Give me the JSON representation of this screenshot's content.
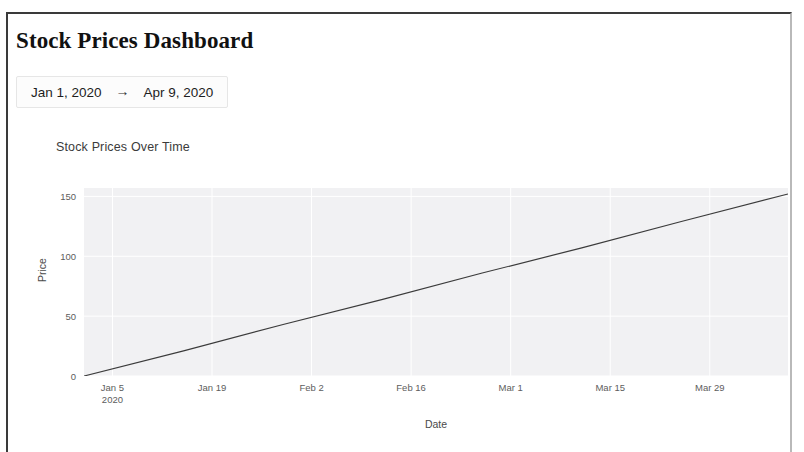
{
  "header": {
    "title": "Stock Prices Dashboard"
  },
  "date_range": {
    "start": "Jan 1, 2020",
    "arrow": "→",
    "end": "Apr 9, 2020"
  },
  "chart_data": {
    "type": "line",
    "title": "Stock Prices Over Time",
    "xlabel": "Date",
    "ylabel": "Price",
    "grid": true,
    "legend": null,
    "plot_bg": "#f1f1f3",
    "gridline_color": "#ffffff",
    "line_color": "#3b3b3b",
    "line_width": 1.2,
    "ylim": [
      0,
      157
    ],
    "yticks": [
      0,
      50,
      100,
      150
    ],
    "ytick_labels": [
      "0",
      "50",
      "100",
      "150"
    ],
    "xlim": [
      "2020-01-01",
      "2020-04-09"
    ],
    "xticks": [
      "2020-01-05",
      "2020-01-19",
      "2020-02-02",
      "2020-02-16",
      "2020-03-01",
      "2020-03-15",
      "2020-03-29"
    ],
    "xtick_labels": [
      {
        "line1": "Jan 5",
        "line2": "2020"
      },
      {
        "line1": "Jan 19",
        "line2": ""
      },
      {
        "line1": "Feb 2",
        "line2": ""
      },
      {
        "line1": "Feb 16",
        "line2": ""
      },
      {
        "line1": "Mar 1",
        "line2": ""
      },
      {
        "line1": "Mar 15",
        "line2": ""
      },
      {
        "line1": "Mar 29",
        "line2": ""
      }
    ],
    "series": [
      {
        "name": "Price",
        "x": [
          "2020-01-01",
          "2020-01-15",
          "2020-01-29",
          "2020-02-12",
          "2020-02-26",
          "2020-03-11",
          "2020-03-25",
          "2020-04-09"
        ],
        "values": [
          0,
          21,
          43,
          64,
          86,
          107,
          129,
          152
        ]
      }
    ]
  }
}
